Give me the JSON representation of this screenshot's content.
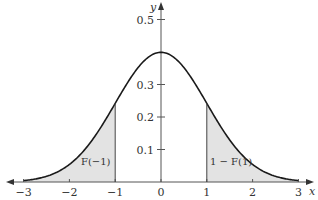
{
  "chart_data": {
    "type": "area",
    "title": "",
    "xlabel": "x",
    "ylabel": "y",
    "xlim": [
      -3,
      3
    ],
    "ylim": [
      0,
      0.5
    ],
    "x_ticks": [
      {
        "value": -3,
        "label": "−3"
      },
      {
        "value": -2,
        "label": "−2"
      },
      {
        "value": -1,
        "label": "−1"
      },
      {
        "value": 0,
        "label": "0"
      },
      {
        "value": 1,
        "label": "1"
      },
      {
        "value": 2,
        "label": "2"
      },
      {
        "value": 3,
        "label": "3"
      }
    ],
    "y_ticks": [
      {
        "value": 0.1,
        "label": "0.1"
      },
      {
        "value": 0.2,
        "label": "0.2"
      },
      {
        "value": 0.3,
        "label": "0.3"
      },
      {
        "value": 0.5,
        "label": "0.5"
      }
    ],
    "series": [
      {
        "name": "standard normal density",
        "x": [
          -3,
          -2.5,
          -2,
          -1.5,
          -1,
          -0.5,
          0,
          0.5,
          1,
          1.5,
          2,
          2.5,
          3
        ],
        "values": [
          0.0044,
          0.0175,
          0.054,
          0.1295,
          0.242,
          0.3521,
          0.3989,
          0.3521,
          0.242,
          0.1295,
          0.054,
          0.0175,
          0.0044
        ]
      }
    ],
    "shaded_regions": [
      {
        "from": -3,
        "to": -1,
        "label": "F(−1)",
        "color": "#e3e3e3"
      },
      {
        "from": 1,
        "to": 3,
        "label": "1 − F(1)",
        "color": "#e3e3e3"
      }
    ],
    "grid": false,
    "legend": null,
    "colors": {
      "curve": "#1a1a1a",
      "axis": "#555555",
      "shade": "#e3e3e3",
      "text": "#333333"
    }
  }
}
